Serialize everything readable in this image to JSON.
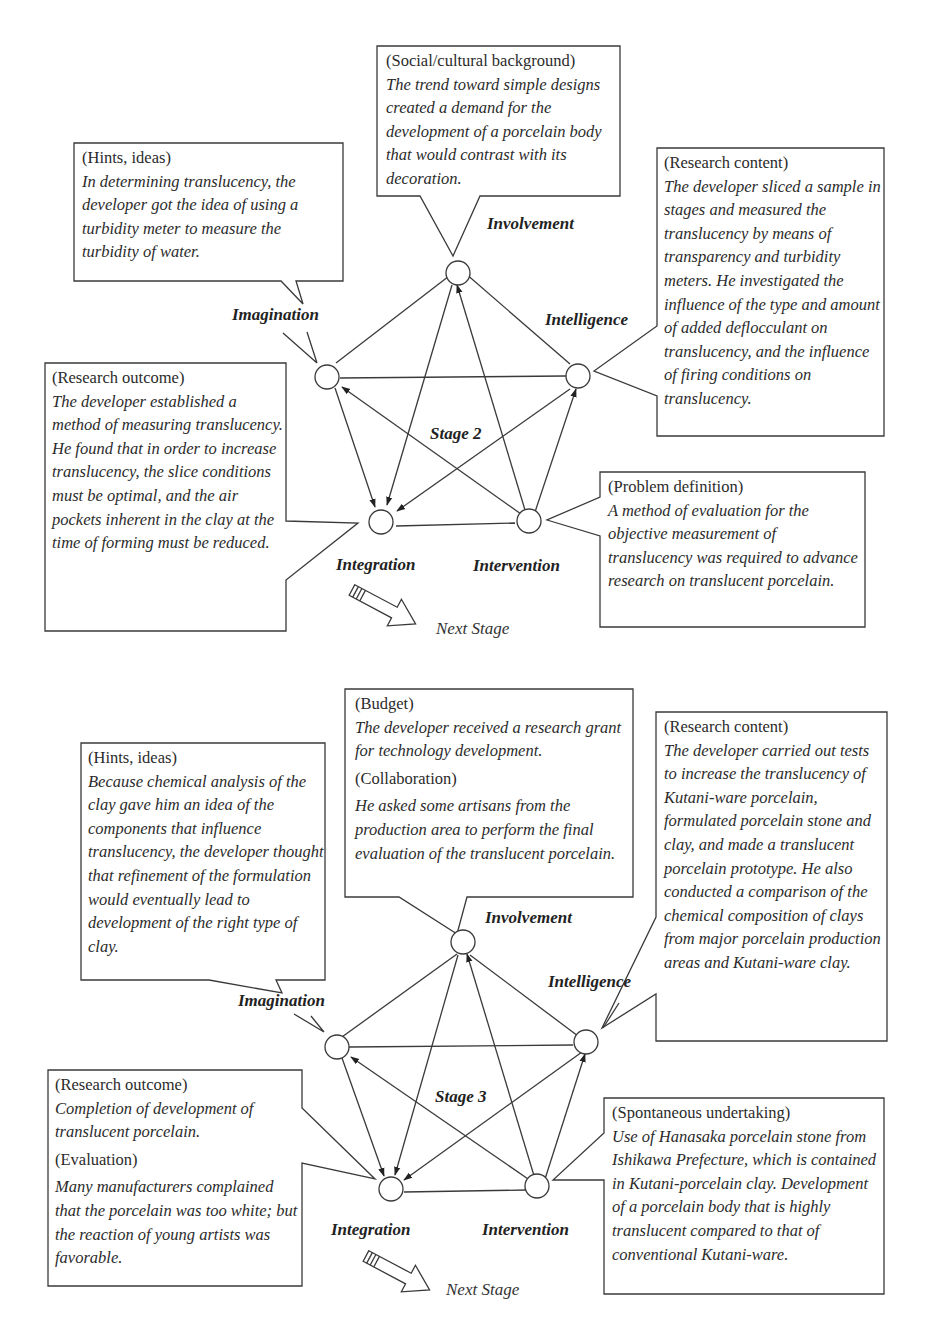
{
  "stage2": {
    "title": "Stage 2",
    "nodes": {
      "involvement": "Involvement",
      "imagination": "Imagination",
      "intelligence": "Intelligence",
      "integration": "Integration",
      "intervention": "Intervention"
    },
    "next_stage": "Next Stage",
    "boxes": {
      "social": {
        "heading": "(Social/cultural background)",
        "text": "The trend toward simple designs created a demand for the development of a porcelain body that would contrast with its decoration."
      },
      "hints": {
        "heading": "(Hints, ideas)",
        "text": "In determining translucency, the developer got the idea of using a turbidity meter to measure the turbidity of water."
      },
      "research_content": {
        "heading": "(Research content)",
        "text": "The developer sliced a sample in stages and measured the translucency by means of transparency and turbidity meters. He investigated the influence of the type and amount of added deflocculant on translucency, and the influence of firing conditions on translucency."
      },
      "research_outcome": {
        "heading": "(Research outcome)",
        "text": "The developer established a method of measuring translucency. He found that in order to increase translucency, the slice conditions must be optimal, and the air pockets inherent in the clay at the time of forming must be reduced."
      },
      "problem_definition": {
        "heading": "(Problem definition)",
        "text": "A method of evaluation for the objective measurement of translucency was required to advance research on translucent porcelain."
      }
    }
  },
  "stage3": {
    "title": "Stage 3",
    "nodes": {
      "involvement": "Involvement",
      "imagination": "Imagination",
      "intelligence": "Intelligence",
      "integration": "Integration",
      "intervention": "Intervention"
    },
    "next_stage": "Next Stage",
    "boxes": {
      "budget": {
        "heading": "(Budget)",
        "text": "The developer received a research grant for technology development.",
        "heading2": "(Collaboration)",
        "text2": "He asked some artisans from the production area to perform the final evaluation of the translucent porcelain."
      },
      "hints": {
        "heading": "(Hints, ideas)",
        "text": "Because chemical analysis of the clay gave him an idea of the components that influence translucency, the developer thought that refinement of the formulation would eventually lead to development of the right type of clay."
      },
      "research_content": {
        "heading": "(Research content)",
        "text": "The developer carried out tests to increase the translucency of Kutani-ware porcelain, formulated porcelain stone and clay, and made a translucent porcelain prototype. He also conducted a comparison of the chemical composition of clays from major porcelain production areas and Kutani-ware clay."
      },
      "research_outcome": {
        "heading": "(Research outcome)",
        "text": "Completion of development of translucent porcelain.",
        "heading2": "(Evaluation)",
        "text2": "Many manufacturers complained that the porcelain was too white; but the reaction of young artists was favorable."
      },
      "spontaneous": {
        "heading": "(Spontaneous undertaking)",
        "text": "Use of Hanasaka porcelain stone from Ishikawa Prefecture, which is contained in Kutani-porcelain clay. Development of a porcelain body that is highly translucent compared to that of conventional Kutani-ware."
      }
    }
  },
  "colors": {
    "line": "#3a3a3a",
    "text": "#2b2b2b",
    "background": "#ffffff"
  }
}
